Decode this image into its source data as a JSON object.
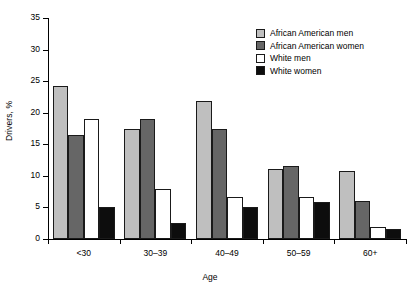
{
  "chart_data": {
    "type": "bar",
    "title": "",
    "xlabel": "Age",
    "ylabel": "Drivers, %",
    "categories": [
      "<30",
      "30–39",
      "40–49",
      "50–59",
      "60+"
    ],
    "series": [
      {
        "name": "African American men",
        "color": "#bfbfbf",
        "values": [
          24.2,
          17.5,
          21.8,
          11.1,
          10.7
        ]
      },
      {
        "name": "African American women",
        "color": "#666666",
        "values": [
          16.5,
          19.0,
          17.5,
          11.6,
          6.0
        ]
      },
      {
        "name": "White men",
        "color": "#ffffff",
        "values": [
          19.0,
          8.0,
          6.7,
          6.6,
          1.9
        ]
      },
      {
        "name": "White women",
        "color": "#0d0d0d",
        "values": [
          5.0,
          2.6,
          5.1,
          5.9,
          1.6
        ]
      }
    ],
    "ylim": [
      0,
      35
    ],
    "yticks": [
      0,
      5,
      10,
      15,
      20,
      25,
      30,
      35
    ],
    "ytick_labels": [
      "0",
      "5",
      "10",
      "15",
      "20",
      "25",
      "30",
      "35"
    ],
    "grid": false,
    "legend_position": "top-right",
    "legend_entries": [
      "African American men",
      "African American women",
      "White men",
      "White women"
    ]
  }
}
